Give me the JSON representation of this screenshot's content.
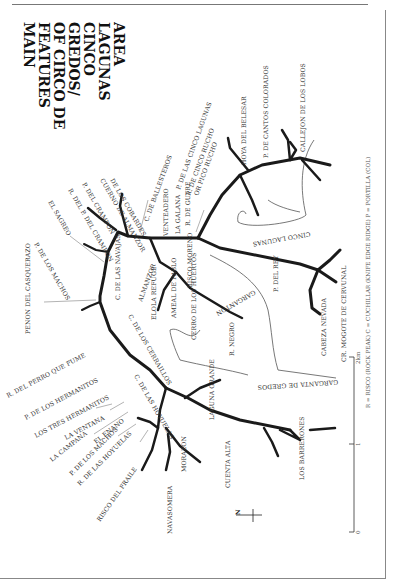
{
  "title": {
    "lines": [
      "MAIN",
      "FEATURES",
      "OF CIRCO DE",
      "GREDOS/",
      "CINCO",
      "LAGUNAS",
      "AREA"
    ]
  },
  "legend": {
    "text": "R = RISCO (ROCK PEAK)   C = CUCHILLAR (KNIFE EDGE RIDGE)   P = PORTILLA (COL)"
  },
  "scale_bar": {
    "unit_label": "2km",
    "ticks": [
      "0",
      "1",
      "2km"
    ]
  },
  "north_arrow": {
    "label": "N"
  },
  "features": {
    "hoya_del_belesar": "HOYA DEL BELESAR",
    "p_de_cantos_colorados": "P. DE CANTOS COLORADOS",
    "callejon_de_los_lobos": "CALLEJON DE LOS LOBOS",
    "p_de_las_cinco_lagunas": "P. DE LAS CINCO LAGUNAS",
    "r_de_cinco_ruchi": "R. DE CINCO RUCHO",
    "or_pico_rucho": "OR PICO RUCHO",
    "r_de_gutre": "R. DE GUTRE",
    "la_galana": "LA GALANA",
    "venteadero": "VENTEADERO",
    "c_de_ballesteros": "C. DE BALLESTEROS",
    "cuerno_de_los_cobardes": "DE LOS COBARDES",
    "cuerno_de_almanzor": "CUERNO DE ALMANZOR",
    "p_del_crampon": "P. DEL CRAMPON",
    "r_del_p_del_crampon": "R. DEL P. DEL CRAMPON",
    "el_sagreo": "EL SAGREO",
    "p_de_los_machos_upper": "P. DE LOS MACHOS",
    "penon_del_casquerazo": "PENON DEL CASQUERAZO",
    "r_del_perro_que_fume": "R. DEL PERRO QUE FUME",
    "p_de_los_hermanitos": "P. DE LOS HERMANITOS",
    "los_tres_hermanitos": "LOS TRES HERMANITOS",
    "la_ventana": "LA VENTANA",
    "la_campana": "LA CAMPANA",
    "el_enano": "EL ENANO",
    "p_de_los_machos": "P. DE LOS MACHOS",
    "r_de_las_hoyuelas": "R. DE LAS HOYUELAS",
    "risco_del_fraile": "RISCO DEL FRAILE",
    "navasomera": "NAVASOMERA",
    "morazon": "MORAZON",
    "cuenta_alta": "CUENTA ALTA",
    "los_barrerones": "LOS BARRERONES",
    "c_de_las_navajas": "C. DE LAS NAVAJAS",
    "almanzor": "ALMANZOR",
    "c_de_los_cerraillos": "C. DE LOS CERRAILLOS",
    "c_de_las_hoyuelas": "C. DE LAS HOYUELAS",
    "elola_refuge": "ELOLA REFUGE",
    "ameal_de_pablo": "AMEAL DE PABLO",
    "risco_moreno": "RISCO MORENO",
    "cerro_de_los_huertos": "CERRO DE LOS HUERTOS",
    "r_negro": "R. NEGRO",
    "laguna_grande": "LAGUNA GRANDE",
    "garganta_de_gredos": "GARGANTA DE GREDOS",
    "gargantón": "GARGANTON",
    "cinco_lagunas": "CINCO LAGUNAS",
    "p_del_rey": "P. DEL REY",
    "cabeza_nevada": "CABEZA NEVADA",
    "cr_mogote_de_cervunal": "CR. MOGOTE DE CERVUNAL"
  }
}
